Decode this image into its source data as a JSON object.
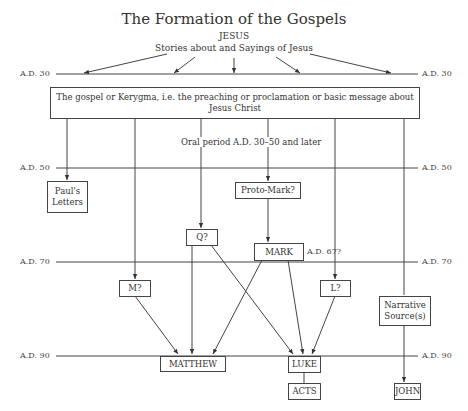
{
  "title": "The Formation of the Gospels",
  "source": {
    "name": "JESUS",
    "subtitle": "Stories about and Sayings of Jesus"
  },
  "timeline": [
    {
      "label": "A.D. 30",
      "y": 74
    },
    {
      "label": "A.D. 50",
      "y": 168
    },
    {
      "label": "A.D. 70",
      "y": 262
    },
    {
      "label": "A.D. 90",
      "y": 356
    }
  ],
  "kerygma_box": "The gospel or Kerygma, i.e. the preaching or proclamation or basic message about Jesus Christ",
  "oral_period": "Oral period A.D. 30–50 and later",
  "nodes": {
    "pauls_letters": "Paul's Letters",
    "proto_mark": "Proto-Mark?",
    "q": "Q?",
    "mark": "MARK",
    "mark_date": "A.D. 67?",
    "m": "M?",
    "l": "L?",
    "narrative_sources": "Narrative Source(s)",
    "matthew": "MATTHEW",
    "luke": "LUKE",
    "acts": "ACTS",
    "john": "JOHN"
  },
  "edges": [
    [
      "JESUS",
      "A.D. 30"
    ],
    [
      "Kerygma",
      "Paul's Letters"
    ],
    [
      "Kerygma",
      "M?"
    ],
    [
      "Kerygma",
      "Q?"
    ],
    [
      "Kerygma",
      "Proto-Mark?"
    ],
    [
      "Proto-Mark?",
      "MARK"
    ],
    [
      "Kerygma",
      "L?"
    ],
    [
      "Kerygma",
      "Narrative Source(s)"
    ],
    [
      "M?",
      "MATTHEW"
    ],
    [
      "Q?",
      "MATTHEW"
    ],
    [
      "MARK",
      "MATTHEW"
    ],
    [
      "Q?",
      "LUKE"
    ],
    [
      "MARK",
      "LUKE"
    ],
    [
      "L?",
      "LUKE"
    ],
    [
      "LUKE",
      "ACTS"
    ],
    [
      "Narrative Source(s)",
      "JOHN"
    ]
  ]
}
